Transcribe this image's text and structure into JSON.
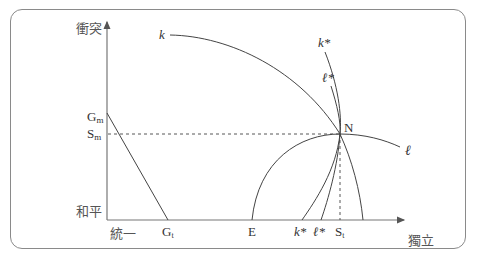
{
  "diagram": {
    "axes": {
      "y_top_label": "衝突",
      "y_bottom_label": "和平",
      "x_left_label": "統一",
      "x_right_label": "獨立"
    },
    "y_ticks": {
      "g_m": {
        "main": "G",
        "sub": "m"
      },
      "s_m": {
        "main": "S",
        "sub": "m"
      }
    },
    "x_ticks": {
      "g_t": {
        "main": "G",
        "sub": "t"
      },
      "e": "E",
      "k_star": "k*",
      "l_star": "ℓ*",
      "s_t": {
        "main": "S",
        "sub": "t"
      }
    },
    "curves": {
      "k": "k",
      "k_star": "k*",
      "l_star": "ℓ*",
      "l": "ℓ"
    },
    "point_n": "N",
    "colors": {
      "line": "#444444",
      "axis": "#777777",
      "frame": "#8a8a8a"
    }
  }
}
